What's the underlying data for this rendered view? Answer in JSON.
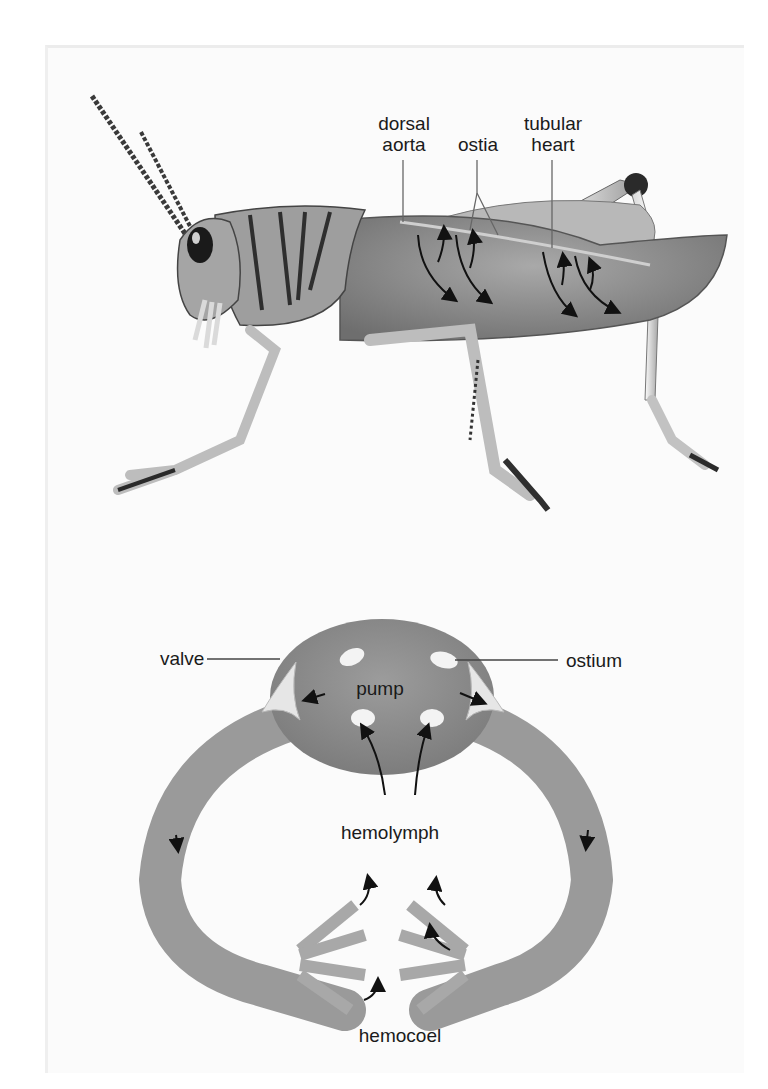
{
  "figure": {
    "top_panel": {
      "subject": "grasshopper",
      "labels": {
        "dorsal_aorta": "dorsal\naorta",
        "dorsal_aorta_l1": "dorsal",
        "dorsal_aorta_l2": "aorta",
        "ostia": "ostia",
        "tubular_heart_l1": "tubular",
        "tubular_heart_l2": "heart"
      }
    },
    "bottom_panel": {
      "subject": "open circulatory system schematic",
      "labels": {
        "valve": "valve",
        "ostium": "ostium",
        "pump": "pump",
        "hemolymph": "hemolymph",
        "hemocoel": "hemocoel"
      }
    },
    "colors": {
      "background": "#ffffff",
      "panel": "#fbfbfb",
      "body_gray": "#8a8a8a",
      "vessel_gray": "#9a9a9a",
      "pump_gray": "#8c8c8c",
      "text": "#1a1a1a",
      "arrow": "#111111"
    }
  }
}
